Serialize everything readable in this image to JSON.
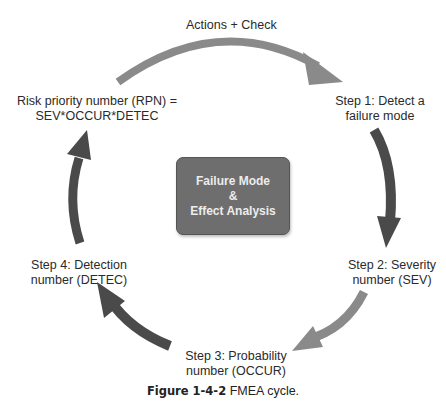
{
  "diagram": {
    "center": {
      "line1": "Failure Mode",
      "line2": "&",
      "line3": "Effect Analysis"
    },
    "nodes": [
      {
        "id": "top",
        "text": "Actions + Check"
      },
      {
        "id": "step1",
        "line1": "Step 1: Detect a",
        "line2": "failure mode"
      },
      {
        "id": "step2",
        "line1": "Step 2: Severity",
        "line2": "number (SEV)"
      },
      {
        "id": "step3",
        "line1": "Step 3: Probability",
        "line2": "number (OCCUR)"
      },
      {
        "id": "step4",
        "line1": "Step 4: Detection",
        "line2": "number (DETEC)"
      },
      {
        "id": "rpn",
        "line1": "Risk priority number (RPN) =",
        "line2": "SEV*OCCUR*DETEC"
      }
    ],
    "colors": {
      "light_arrow": "#8a8a8a",
      "dark_arrow": "#4a4a4a",
      "center_box": "#6e6e6e"
    }
  },
  "caption": {
    "label": "Figure 1-4-2",
    "text": "FMEA cycle."
  }
}
